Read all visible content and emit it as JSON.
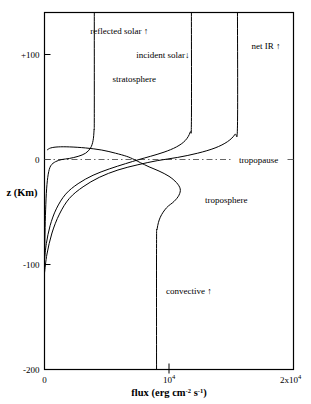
{
  "chart_data": {
    "type": "line",
    "title": "",
    "xlabel": "flux (erg cm-2 s-1)",
    "xlabel_parts": {
      "lead": "flux (erg cm",
      "sup1": "-2",
      "mid": " s",
      "sup2": "-1",
      "tail": ")"
    },
    "ylabel": "z (Km)",
    "xlim": [
      0,
      20000
    ],
    "ylim": [
      -200,
      140
    ],
    "grid": false,
    "legend": "inline-annotations",
    "xticks": [
      {
        "value": 0,
        "label": "0"
      },
      {
        "value": 10000,
        "label": "104",
        "mantissa": "10",
        "exponent": "4"
      },
      {
        "value": 20000,
        "label": "2x104",
        "mantissa": "2x10",
        "exponent": "4"
      }
    ],
    "yticks": [
      {
        "value": 100,
        "label": "+100"
      },
      {
        "value": 0,
        "label": "0"
      },
      {
        "value": -100,
        "label": "-100"
      },
      {
        "value": -200,
        "label": "-200"
      }
    ],
    "annotations": [
      {
        "name": "reflected-solar",
        "text": "reflected solar ↑",
        "x": 6000,
        "y": 122
      },
      {
        "name": "incident-solar",
        "text": "incident solar↓",
        "x": 9500,
        "y": 100
      },
      {
        "name": "net-ir",
        "text": "net IR ↑",
        "x": 17800,
        "y": 108
      },
      {
        "name": "stratosphere",
        "text": "stratosphere",
        "x": 7200,
        "y": 77
      },
      {
        "name": "tropopause",
        "text": "tropopause",
        "x": 17200,
        "y": 0
      },
      {
        "name": "troposphere",
        "text": "troposphere",
        "x": 14600,
        "y": -39
      },
      {
        "name": "convective",
        "text": "convective ↑",
        "x": 11600,
        "y": -125
      }
    ],
    "series": [
      {
        "name": "reflected solar",
        "direction": "up",
        "asymptote_flux": 4000,
        "points": [
          [
            4000,
            140
          ],
          [
            4000,
            40
          ],
          [
            3980,
            28
          ],
          [
            3900,
            18
          ],
          [
            3700,
            11
          ],
          [
            3300,
            6
          ],
          [
            2700,
            3
          ],
          [
            2000,
            1
          ],
          [
            1400,
            0
          ],
          [
            900,
            -2
          ],
          [
            500,
            -6
          ],
          [
            300,
            -14
          ],
          [
            170,
            -28
          ],
          [
            90,
            -48
          ],
          [
            40,
            -70
          ],
          [
            15,
            -88
          ],
          [
            0,
            -100
          ]
        ]
      },
      {
        "name": "incident solar",
        "direction": "down",
        "asymptote_flux": 11800,
        "points": [
          [
            11800,
            140
          ],
          [
            11800,
            36
          ],
          [
            11700,
            26
          ],
          [
            11300,
            18
          ],
          [
            10600,
            12
          ],
          [
            9600,
            7
          ],
          [
            8500,
            3
          ],
          [
            7600,
            0
          ],
          [
            6500,
            -4
          ],
          [
            5200,
            -9
          ],
          [
            3900,
            -15
          ],
          [
            2700,
            -23
          ],
          [
            1700,
            -33
          ],
          [
            950,
            -47
          ],
          [
            450,
            -63
          ],
          [
            150,
            -80
          ],
          [
            0,
            -95
          ]
        ]
      },
      {
        "name": "net IR",
        "direction": "up",
        "asymptote_flux": 15500,
        "points": [
          [
            15500,
            140
          ],
          [
            15500,
            32
          ],
          [
            15300,
            24
          ],
          [
            14700,
            17
          ],
          [
            13700,
            11
          ],
          [
            12300,
            6
          ],
          [
            10700,
            2
          ],
          [
            9100,
            -1
          ],
          [
            7500,
            -5
          ],
          [
            5900,
            -10
          ],
          [
            4400,
            -17
          ],
          [
            3100,
            -26
          ],
          [
            2000,
            -37
          ],
          [
            1200,
            -52
          ],
          [
            600,
            -70
          ],
          [
            200,
            -90
          ],
          [
            0,
            -108
          ]
        ]
      },
      {
        "name": "convective",
        "direction": "up",
        "asymptote_flux": 9000,
        "points": [
          [
            9000,
            -200
          ],
          [
            9000,
            -80
          ],
          [
            9050,
            -66
          ],
          [
            9300,
            -55
          ],
          [
            9800,
            -46
          ],
          [
            10400,
            -40
          ],
          [
            10800,
            -34
          ],
          [
            10900,
            -28
          ],
          [
            10600,
            -22
          ],
          [
            10000,
            -16
          ],
          [
            9200,
            -11
          ],
          [
            8400,
            -7
          ],
          [
            7700,
            -3
          ],
          [
            7200,
            0
          ],
          [
            6600,
            3
          ],
          [
            5700,
            6
          ],
          [
            4600,
            9
          ],
          [
            3300,
            11
          ],
          [
            2000,
            12
          ],
          [
            1100,
            12
          ],
          [
            500,
            11
          ],
          [
            200,
            9
          ]
        ]
      }
    ],
    "tropopause_line": {
      "y": 0,
      "style": "dash-dot",
      "from_flux": 0,
      "to_flux": 20000
    }
  }
}
